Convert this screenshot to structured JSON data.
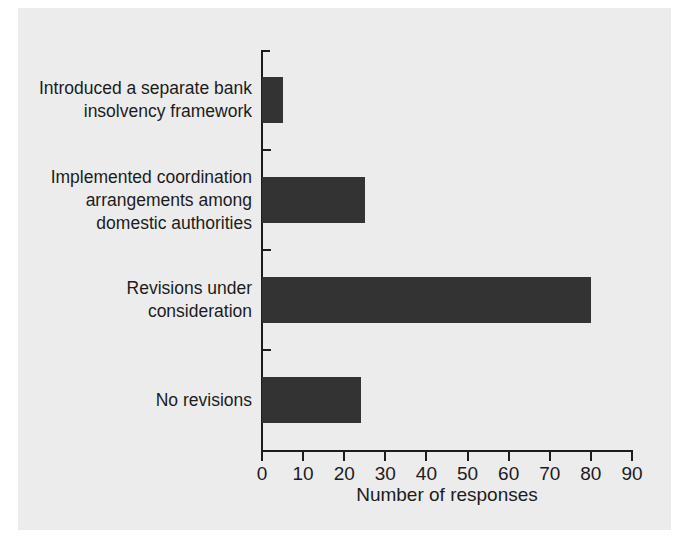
{
  "chart_data": {
    "type": "bar",
    "orientation": "horizontal",
    "title": "",
    "xlabel": "Number of responses",
    "ylabel": "",
    "categories": [
      "Introduced a separate bank\ninsolvency framework",
      "Implemented coordination\narrangements among\ndomestic authorities",
      "Revisions under\nconsideration",
      "No revisions"
    ],
    "values": [
      5,
      25,
      80,
      24
    ],
    "xlim": [
      0,
      90
    ],
    "xticks": [
      0,
      10,
      20,
      30,
      40,
      50,
      60,
      70,
      80,
      90
    ],
    "xtick_labels": [
      "0",
      "10",
      "20",
      "30",
      "40",
      "50",
      "60",
      "70",
      "80",
      "90"
    ],
    "grid": false,
    "legend": null,
    "bar_color": "#333333",
    "background_color": "#ececec",
    "axis_color": "#1c1c1c"
  }
}
